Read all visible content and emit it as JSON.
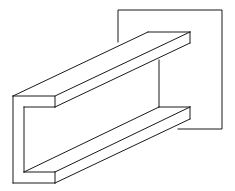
{
  "diagram": {
    "title": "",
    "stroke_color": "#1a1a1a",
    "background": "#ffffff",
    "elements": [
      {
        "name": "wall-plate",
        "shape": "square outline partially hidden behind beam"
      },
      {
        "name": "top-flange",
        "shape": "extruded rectangle"
      },
      {
        "name": "web",
        "shape": "vertical plate"
      },
      {
        "name": "bottom-flange",
        "shape": "extruded rectangle"
      }
    ]
  }
}
